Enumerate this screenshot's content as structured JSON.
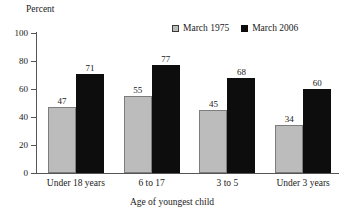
{
  "chart_data": {
    "type": "bar",
    "title": "",
    "xlabel": "Age of youngest child",
    "ylabel": "Percent",
    "categories": [
      "Under 18 years",
      "6 to 17",
      "3 to 5",
      "Under 3 years"
    ],
    "series": [
      {
        "name": "March 1975",
        "color": "#bcbcbc",
        "values": [
          47,
          55,
          45,
          34
        ]
      },
      {
        "name": "March 2006",
        "color": "#0d0d0d",
        "values": [
          71,
          77,
          68,
          60
        ]
      }
    ],
    "ylim": [
      0,
      100
    ],
    "yticks": [
      0,
      20,
      40,
      60,
      80,
      100
    ],
    "ytick_labels": [
      "0",
      "20",
      "40",
      "60",
      "80",
      "100"
    ],
    "grid": false,
    "legend_position": "top-right",
    "value_labels": true
  },
  "axis": {
    "y_title": "Percent",
    "x_title": "Age of youngest child"
  },
  "legend": {
    "entries": [
      {
        "label": "March 1975",
        "swatch": "legend-swatch-light-gray"
      },
      {
        "label": "March 2006",
        "swatch": "legend-swatch-black"
      }
    ]
  }
}
